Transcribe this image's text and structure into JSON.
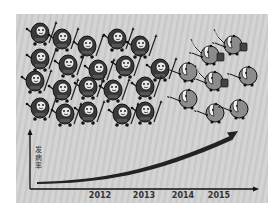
{
  "figure": {
    "y_axis_label": "发病率",
    "x_ticks": [
      {
        "label": "2012",
        "x": 100
      },
      {
        "label": "2013",
        "x": 144
      },
      {
        "label": "2014",
        "x": 183
      },
      {
        "label": "2015",
        "x": 219
      }
    ],
    "caption": "",
    "groups": {
      "left_group": "dark round soldiers with spears",
      "right_group": "hooded soldiers with swords, spears and shields"
    },
    "colors": {
      "background": "#cccccc",
      "ink": "#222222",
      "soldier_dark": "#3a3a3a",
      "soldier_light": "#8c8c8c"
    }
  },
  "chart_data": {
    "type": "line",
    "title": "",
    "xlabel": "",
    "ylabel": "发病率",
    "categories": [
      "2012",
      "2013",
      "2014",
      "2015"
    ],
    "series": [
      {
        "name": "发病率 trend",
        "values": [
          1,
          2,
          3.5,
          6
        ]
      }
    ],
    "grid": false,
    "legend": "none"
  }
}
